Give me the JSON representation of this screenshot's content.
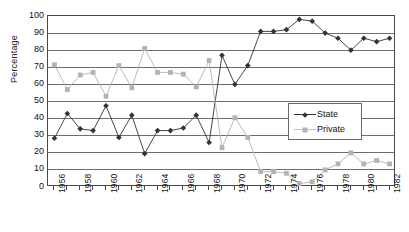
{
  "chart_data": {
    "type": "line",
    "title": "",
    "xlabel": "",
    "ylabel": "Percentage",
    "ylim": [
      0,
      100
    ],
    "ytick_step": 10,
    "yticks": [
      0,
      10,
      20,
      30,
      40,
      50,
      60,
      70,
      80,
      90,
      100
    ],
    "grid": true,
    "legend_position": "center-right inside plot",
    "x": [
      1956,
      1957,
      1958,
      1959,
      1960,
      1961,
      1962,
      1963,
      1964,
      1965,
      1966,
      1967,
      1968,
      1969,
      1970,
      1971,
      1972,
      1973,
      1974,
      1975,
      1976,
      1977,
      1978,
      1979,
      1980,
      1981,
      1982
    ],
    "xtick_labels": [
      "1956",
      "",
      "1958",
      "",
      "1960",
      "",
      "1962",
      "",
      "1964",
      "",
      "1966",
      "",
      "1968",
      "",
      "1970",
      "",
      "1972",
      "",
      "1974",
      "",
      "1976",
      "",
      "1978",
      "",
      "1980",
      "",
      "1982"
    ],
    "xtick_labels_shown": [
      "1956",
      "1958",
      "1960",
      "1962",
      "1964",
      "1966",
      "1968",
      "1970",
      "1972",
      "1974",
      "1976",
      "1978",
      "1980",
      "1982"
    ],
    "series": [
      {
        "name": "State",
        "color": "#333333",
        "marker": "diamond",
        "values": [
          28.5,
          43,
          34,
          33,
          47.5,
          29,
          42,
          19.5,
          33,
          33,
          34.5,
          42,
          26,
          77,
          60,
          71,
          91,
          91,
          92,
          98,
          97,
          90,
          87,
          80,
          87,
          85,
          87
        ]
      },
      {
        "name": "Private",
        "color": "#b3b3b3",
        "marker": "square",
        "values": [
          71.5,
          57,
          65.5,
          67,
          53,
          71,
          58,
          81,
          67,
          67,
          66,
          58.5,
          74,
          23,
          40.5,
          29,
          9,
          9,
          8,
          2,
          3,
          10,
          13.5,
          20,
          13.5,
          15.5,
          13.5
        ]
      }
    ]
  },
  "legend": {
    "items": [
      {
        "label": "State"
      },
      {
        "label": "Private"
      }
    ]
  },
  "colors": {
    "state": "#333333",
    "private": "#b3b3b3",
    "axis": "#4a4a4a",
    "grid": "#6e6e6e",
    "background": "#ffffff"
  }
}
